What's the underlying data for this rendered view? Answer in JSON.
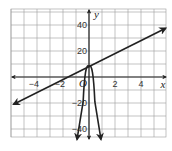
{
  "chart_data": {
    "type": "line",
    "title": "",
    "xlabel": "x",
    "ylabel": "y",
    "xlim": [
      -6,
      6
    ],
    "ylim": [
      -46,
      52
    ],
    "grid": true,
    "x_grid_step": 1,
    "y_grid_step": 10,
    "x_ticks": [
      -4,
      -2,
      0,
      2,
      4
    ],
    "x_tick_labels": [
      "−4",
      "−2",
      "O",
      "2",
      "4"
    ],
    "y_ticks": [
      40,
      20,
      -20,
      -40
    ],
    "y_tick_labels": [
      "40",
      "20",
      "−20",
      "−40"
    ],
    "series": [
      {
        "name": "line",
        "kind": "linear",
        "equation": "y = 5x + 8",
        "slope": 5,
        "intercept": 8,
        "x": [
          -5.8,
          5.9
        ],
        "y": [
          -21,
          37.5
        ],
        "arrows": "both",
        "color": "#222222"
      },
      {
        "name": "parabola",
        "kind": "quadratic",
        "vertex": [
          0,
          8
        ],
        "opens": "down",
        "x": [
          -0.92,
          -0.45,
          0,
          0.45,
          0.92
        ],
        "y": [
          -48,
          -19,
          8,
          -19,
          -48
        ],
        "arrows": "both-down",
        "color": "#222222"
      }
    ],
    "intersection": [
      0,
      8
    ]
  },
  "colors": {
    "grid": "#9a9a9a",
    "axis": "#222222",
    "curve": "#222222",
    "background": "#ffffff"
  }
}
